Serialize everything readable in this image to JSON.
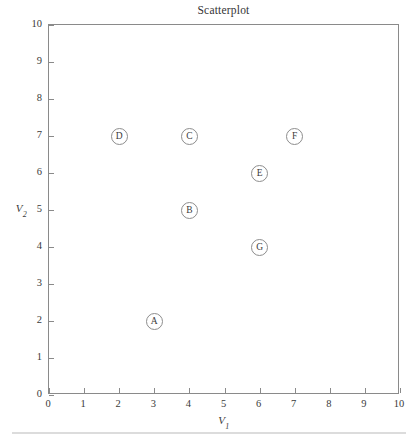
{
  "chart_data": {
    "type": "scatter",
    "title": "Scatterplot",
    "xlabel": "V1",
    "ylabel": "V2",
    "xlabel_base": "V",
    "xlabel_sub": "1",
    "ylabel_base": "V",
    "ylabel_sub": "2",
    "xlim": [
      0,
      10
    ],
    "ylim": [
      0,
      10
    ],
    "xticks": [
      "0",
      "1",
      "2",
      "3",
      "4",
      "5",
      "6",
      "7",
      "8",
      "9",
      "10"
    ],
    "yticks": [
      "0",
      "1",
      "2",
      "3",
      "4",
      "5",
      "6",
      "7",
      "8",
      "9",
      "10"
    ],
    "grid": false,
    "legend": false,
    "marker_style": "open-circle-with-letter",
    "marker_color": "#8d8d8d",
    "frame_color": "#8a8a8a",
    "points": [
      {
        "label": "A",
        "x": 3,
        "y": 2
      },
      {
        "label": "B",
        "x": 4,
        "y": 5
      },
      {
        "label": "C",
        "x": 4,
        "y": 7
      },
      {
        "label": "D",
        "x": 2,
        "y": 7
      },
      {
        "label": "E",
        "x": 6,
        "y": 6
      },
      {
        "label": "F",
        "x": 7,
        "y": 7
      },
      {
        "label": "G",
        "x": 6,
        "y": 4
      }
    ]
  }
}
